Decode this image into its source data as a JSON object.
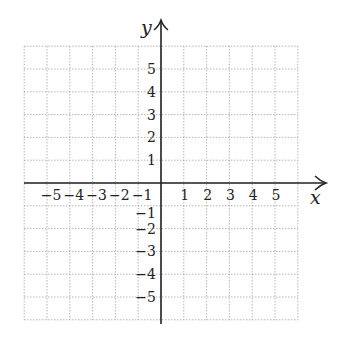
{
  "chart_data": {
    "type": "scatter",
    "title": "",
    "xlabel": "x",
    "ylabel": "y",
    "xlim": [
      -6,
      6
    ],
    "ylim": [
      -6,
      6
    ],
    "grid": true,
    "grid_style": "dotted",
    "x_tick_labels": [
      "−5",
      "−4",
      "−3",
      "−2",
      "−1",
      "1",
      "2",
      "3",
      "4",
      "5"
    ],
    "y_tick_labels": [
      "5",
      "4",
      "3",
      "2",
      "1",
      "−1",
      "−2",
      "−3",
      "−4",
      "−5"
    ],
    "x_ticks": [
      -5,
      -4,
      -3,
      -2,
      -1,
      1,
      2,
      3,
      4,
      5
    ],
    "y_ticks": [
      5,
      4,
      3,
      2,
      1,
      -1,
      -2,
      -3,
      -4,
      -5
    ],
    "series": []
  },
  "labels": {
    "x_axis": "x",
    "y_axis": "y"
  },
  "colors": {
    "axis": "#222222",
    "grid": "#9a9a9a"
  }
}
